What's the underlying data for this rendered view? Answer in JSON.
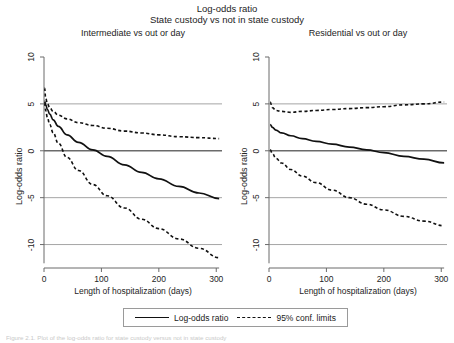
{
  "figure": {
    "title_line1": "Log-odds ratio",
    "title_line2": "State custody vs not in state custody",
    "caption": "Figure 2.1.  Plot of the log-odds ratio for state custody versus not in state custody"
  },
  "legend": {
    "solid_label": "Log-odds ratio",
    "dashed_label": "95% conf. limits",
    "solid_swatch": "solid-line-swatch",
    "dashed_swatch": "dashed-line-swatch"
  },
  "chart_data": [
    {
      "type": "line",
      "panel": "left",
      "title": "Intermediate vs out or day",
      "xlabel": "Length of hospitalization (days)",
      "ylabel": "Log-odds ratio",
      "xlim": [
        0,
        310
      ],
      "ylim": [
        -12.5,
        10
      ],
      "xticks": [
        0,
        100,
        200,
        300
      ],
      "yticks": [
        10,
        5,
        0,
        -5,
        -10
      ],
      "xticklabels": [
        "0",
        "100",
        "200",
        "300"
      ],
      "yticklabels": [
        "10",
        "5",
        "0",
        "-5",
        "-10"
      ],
      "grid": "horizontal-at-yticks",
      "series": [
        {
          "name": "Log-odds ratio",
          "style": "solid",
          "x": [
            1,
            3,
            6,
            10,
            16,
            25,
            40,
            60,
            85,
            110,
            140,
            170,
            200,
            235,
            270,
            305
          ],
          "y": [
            5.3,
            4.9,
            4.4,
            3.9,
            3.3,
            2.6,
            1.7,
            0.9,
            0.1,
            -0.6,
            -1.5,
            -2.3,
            -3.0,
            -3.8,
            -4.5,
            -5.1
          ]
        },
        {
          "name": "95% upper conf. limit",
          "style": "dashed",
          "x": [
            1,
            3,
            6,
            10,
            16,
            25,
            40,
            60,
            85,
            110,
            140,
            170,
            200,
            235,
            270,
            305
          ],
          "y": [
            6.7,
            5.6,
            5.0,
            4.6,
            4.2,
            3.8,
            3.4,
            3.0,
            2.7,
            2.4,
            2.1,
            1.9,
            1.7,
            1.5,
            1.4,
            1.3
          ]
        },
        {
          "name": "95% lower conf. limit",
          "style": "dashed",
          "x": [
            1,
            3,
            6,
            10,
            16,
            25,
            40,
            60,
            85,
            110,
            140,
            170,
            200,
            235,
            270,
            305
          ],
          "y": [
            5.1,
            4.3,
            3.5,
            2.8,
            1.9,
            0.8,
            -0.7,
            -2.1,
            -3.6,
            -4.8,
            -6.1,
            -7.3,
            -8.3,
            -9.4,
            -10.4,
            -11.4
          ]
        }
      ]
    },
    {
      "type": "line",
      "panel": "right",
      "title": "Residential vs out or day",
      "xlabel": "Length of hospitalization (days)",
      "ylabel": "Log-odds ratio",
      "xlim": [
        0,
        310
      ],
      "ylim": [
        -12.5,
        10
      ],
      "xticks": [
        0,
        100,
        200,
        300
      ],
      "yticks": [
        10,
        5,
        0,
        -5,
        -10
      ],
      "xticklabels": [
        "0",
        "100",
        "200",
        "300"
      ],
      "yticklabels": [
        "10",
        "5",
        "0",
        "-5",
        "-10"
      ],
      "grid": "horizontal-at-yticks",
      "series": [
        {
          "name": "Log-odds ratio",
          "style": "solid",
          "x": [
            2,
            6,
            12,
            22,
            38,
            58,
            82,
            110,
            140,
            170,
            200,
            235,
            270,
            305
          ],
          "y": [
            2.8,
            2.5,
            2.2,
            1.9,
            1.6,
            1.3,
            1.0,
            0.7,
            0.4,
            0.1,
            -0.2,
            -0.6,
            -0.9,
            -1.3
          ]
        },
        {
          "name": "95% upper conf. limit",
          "style": "dashed",
          "x": [
            2,
            6,
            12,
            22,
            38,
            58,
            82,
            110,
            140,
            170,
            200,
            235,
            270,
            305
          ],
          "y": [
            5.2,
            4.6,
            4.3,
            4.2,
            4.1,
            4.2,
            4.3,
            4.4,
            4.5,
            4.6,
            4.7,
            4.9,
            5.0,
            5.2
          ]
        },
        {
          "name": "95% lower conf. limit",
          "style": "dashed",
          "x": [
            2,
            6,
            12,
            22,
            38,
            58,
            82,
            110,
            140,
            170,
            200,
            235,
            270,
            305
          ],
          "y": [
            0.1,
            -0.3,
            -0.8,
            -1.3,
            -2.0,
            -2.7,
            -3.4,
            -4.2,
            -5.0,
            -5.7,
            -6.3,
            -7.0,
            -7.5,
            -8.0
          ]
        }
      ]
    }
  ]
}
